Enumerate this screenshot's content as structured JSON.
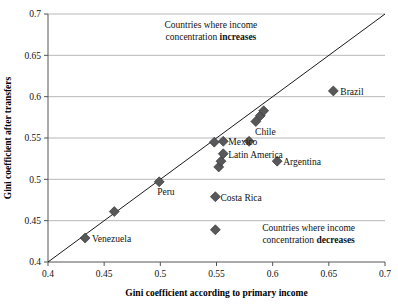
{
  "chart_data": {
    "type": "scatter",
    "title": "",
    "xlabel": "Gini coefficient according to primary income",
    "ylabel": "Gini coefficient after transfers",
    "xlim": [
      0.4,
      0.7
    ],
    "ylim": [
      0.4,
      0.7
    ],
    "xticks": [
      "0.4",
      "0.45",
      "0.5",
      "0.55",
      "0.6",
      "0.65",
      "0.7"
    ],
    "yticks": [
      "0.7",
      "0.65",
      "0.6",
      "0.55",
      "0.5",
      "0.45",
      "0.4"
    ],
    "xtick_values": [
      0.4,
      0.45,
      0.5,
      0.55,
      0.6,
      0.65,
      0.7
    ],
    "ytick_values": [
      0.7,
      0.65,
      0.6,
      0.55,
      0.5,
      0.45,
      0.4
    ],
    "grid": "horizontal",
    "legend": "none",
    "reference_line": {
      "name": "45-degree-line",
      "from": [
        0.4,
        0.4
      ],
      "to": [
        0.7,
        0.7
      ],
      "label": "y = x"
    },
    "marker": {
      "shape": "diamond",
      "color": "#58585a",
      "edge_color": "#2b2b2b",
      "size": 5
    },
    "points": [
      {
        "label": "Venezuela",
        "x": 0.433,
        "y": 0.429,
        "label_dx": 7,
        "label_dy": 4,
        "label_anchor": "start"
      },
      {
        "label": "",
        "x": 0.459,
        "y": 0.461,
        "label_dx": 0,
        "label_dy": 0,
        "label_anchor": "start"
      },
      {
        "label": "Peru",
        "x": 0.499,
        "y": 0.497,
        "label_dx": -2,
        "label_dy": 13,
        "label_anchor": "start"
      },
      {
        "label": "",
        "x": 0.549,
        "y": 0.439,
        "label_dx": 0,
        "label_dy": 0,
        "label_anchor": "start"
      },
      {
        "label": "Costa Rica",
        "x": 0.549,
        "y": 0.479,
        "label_dx": 5,
        "label_dy": 4,
        "label_anchor": "start"
      },
      {
        "label": "",
        "x": 0.552,
        "y": 0.515,
        "label_dx": 0,
        "label_dy": 0,
        "label_anchor": "start"
      },
      {
        "label": "",
        "x": 0.554,
        "y": 0.522,
        "label_dx": 0,
        "label_dy": 0,
        "label_anchor": "start"
      },
      {
        "label": "Latin America",
        "x": 0.556,
        "y": 0.531,
        "label_dx": 5,
        "label_dy": 4,
        "label_anchor": "start"
      },
      {
        "label": "",
        "x": 0.548,
        "y": 0.545,
        "label_dx": 0,
        "label_dy": 0,
        "label_anchor": "start"
      },
      {
        "label": "Mexico",
        "x": 0.556,
        "y": 0.546,
        "label_dx": 5,
        "label_dy": 4,
        "label_anchor": "start"
      },
      {
        "label": "Chile",
        "x": 0.579,
        "y": 0.546,
        "label_dx": 6,
        "label_dy": -6,
        "label_anchor": "start"
      },
      {
        "label": "",
        "x": 0.585,
        "y": 0.57,
        "label_dx": 0,
        "label_dy": 0,
        "label_anchor": "start"
      },
      {
        "label": "",
        "x": 0.589,
        "y": 0.577,
        "label_dx": 0,
        "label_dy": 0,
        "label_anchor": "start"
      },
      {
        "label": "",
        "x": 0.592,
        "y": 0.583,
        "label_dx": 0,
        "label_dy": 0,
        "label_anchor": "start"
      },
      {
        "label": "Argentina",
        "x": 0.604,
        "y": 0.522,
        "label_dx": 6,
        "label_dy": 4,
        "label_anchor": "start"
      },
      {
        "label": "Brazil",
        "x": 0.654,
        "y": 0.607,
        "label_dx": 7,
        "label_dy": 4,
        "label_anchor": "start"
      }
    ],
    "annotations": [
      {
        "name": "increases-note",
        "line1": "Countries where income",
        "line2_plain": "concentration ",
        "line2_bold": "increases",
        "x": 0.545,
        "y": 0.683
      },
      {
        "name": "decreases-note",
        "line1": "Countries where income",
        "line2_plain": "concentration ",
        "line2_bold": "decreases",
        "x": 0.632,
        "y": 0.437
      }
    ]
  }
}
